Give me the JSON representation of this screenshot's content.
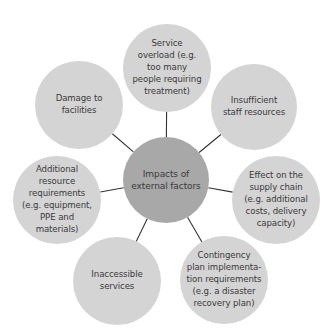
{
  "diagram": {
    "title": "Impacts of external factors",
    "colors": {
      "center_fill": "#a8a8a8",
      "outer_fill": "#d4d4d4",
      "connector": "#333333",
      "text": "#3a3a3a"
    },
    "center": {
      "label": "Impacts of\nexternal factors",
      "cx": 166,
      "cy": 180,
      "r": 43
    },
    "nodes": [
      {
        "id": "service-overload",
        "label": "Service\noverload (e.g.\ntoo many\npeople requiring\ntreatment)",
        "cx": 167,
        "cy": 68,
        "r": 44
      },
      {
        "id": "insufficient-staff",
        "label": "Insufficient\nstaff resources",
        "cx": 254,
        "cy": 107,
        "r": 43
      },
      {
        "id": "supply-chain",
        "label": "Effect on the\nsupply chain\n(e.g. additional\ncosts, delivery\ncapacity)",
        "cx": 276,
        "cy": 200,
        "r": 44
      },
      {
        "id": "contingency-plan",
        "label": "Contingency\nplan implementa-\ntion requirements\n(e.g. a disaster\nrecovery plan)",
        "cx": 224,
        "cy": 280,
        "r": 44
      },
      {
        "id": "inaccessible-services",
        "label": "Inaccessible\nservices",
        "cx": 117,
        "cy": 281,
        "r": 44
      },
      {
        "id": "additional-resources",
        "label": "Additional\nresource\nrequirements\n(e.g. equipment,\nPPE and\nmaterials)",
        "cx": 57,
        "cy": 200,
        "r": 44
      },
      {
        "id": "damage-facilities",
        "label": "Damage to\nfacilities",
        "cx": 79,
        "cy": 105,
        "r": 44
      }
    ]
  }
}
